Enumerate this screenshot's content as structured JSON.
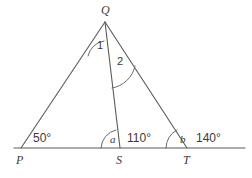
{
  "diagram": {
    "type": "euclidean-geometry-figure",
    "canvas": {
      "width": 252,
      "height": 178,
      "background": "#ffffff"
    },
    "stroke_color": "#5a5a5a",
    "text_color": "#3a3a3a",
    "vertices": [
      {
        "id": "Q",
        "label": "Q",
        "x": 105,
        "y": 22,
        "label_x": 101,
        "label_y": 14
      },
      {
        "id": "P",
        "label": "P",
        "x": 21,
        "y": 148,
        "label_x": 16,
        "label_y": 164
      },
      {
        "id": "S",
        "label": "S",
        "x": 120,
        "y": 148,
        "label_x": 116,
        "label_y": 164
      },
      {
        "id": "T",
        "label": "T",
        "x": 187,
        "y": 148,
        "label_x": 183,
        "label_y": 164
      }
    ],
    "segments": [
      {
        "id": "PQ",
        "from": "P",
        "to": "Q"
      },
      {
        "id": "QT",
        "from": "Q",
        "to": "T"
      },
      {
        "id": "QS",
        "from": "Q",
        "to": "S"
      }
    ],
    "baseline": {
      "id": "PT-extended",
      "x1": 14,
      "y1": 148,
      "x2": 245,
      "y2": 148
    },
    "angle_labels": [
      {
        "id": "angle-1",
        "text": "1",
        "kind": "number",
        "x": 97,
        "y": 49,
        "vertex": "Q",
        "between": [
          "QP",
          "QS"
        ]
      },
      {
        "id": "angle-2",
        "text": "2",
        "kind": "number",
        "x": 117,
        "y": 65,
        "vertex": "Q",
        "between": [
          "QS",
          "QT"
        ]
      },
      {
        "id": "angle-a",
        "text": "a",
        "kind": "variable",
        "x": 110,
        "y": 143,
        "vertex": "S",
        "between": [
          "SP",
          "SQ"
        ]
      },
      {
        "id": "angle-b",
        "text": "b",
        "kind": "variable",
        "x": 180,
        "y": 143,
        "vertex": "T",
        "between": [
          "TS",
          "TQ"
        ]
      },
      {
        "id": "angle-p",
        "text": "50°",
        "kind": "measure",
        "x": 33,
        "y": 142,
        "vertex": "P",
        "between": [
          "PS",
          "PQ"
        ]
      },
      {
        "id": "angle-qst",
        "text": "110°",
        "kind": "measure",
        "x": 127,
        "y": 142,
        "vertex": "S",
        "between": [
          "SQ",
          "ST"
        ]
      },
      {
        "id": "angle-ext-t",
        "text": "140°",
        "kind": "measure",
        "x": 196,
        "y": 142,
        "vertex": "T",
        "between": [
          "TQ",
          "T-extension"
        ]
      }
    ],
    "arcs": [
      {
        "id": "arc-1",
        "at": "Q",
        "d": "M 88 56 A 19 19 0 0 1 104 41"
      },
      {
        "id": "arc-2",
        "at": "Q",
        "d": "M 112 88 A 28 28 0 0 0 135 66"
      },
      {
        "id": "arc-a",
        "at": "S",
        "d": "M 101 148 A 19 19 0 0 1 116 130"
      },
      {
        "id": "arc-b",
        "at": "T",
        "d": "M 166 148 A 21 21 0 0 1 177 130"
      }
    ]
  }
}
